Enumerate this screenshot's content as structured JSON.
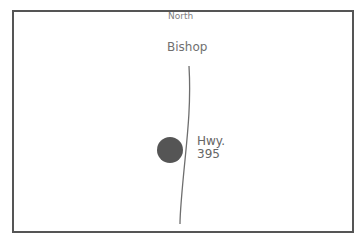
{
  "map": {
    "compass_label": "North",
    "city_label": "Bishop",
    "highway": {
      "line1": "Hwy.",
      "line2": "395"
    },
    "colors": {
      "border": "#555555",
      "road": "#6e6e6e",
      "marker": "#555555",
      "text": "#6a6a6a"
    }
  }
}
